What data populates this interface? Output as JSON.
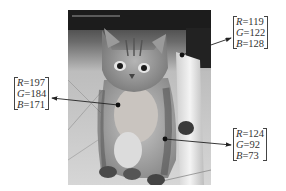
{
  "figure": {
    "image_subject": "cat"
  },
  "callouts": [
    {
      "id": "top-right",
      "position": "top-right",
      "R": {
        "label": "R",
        "value": "=119"
      },
      "G": {
        "label": "G",
        "value": "=122"
      },
      "B": {
        "label": "B",
        "value": "=128"
      },
      "point": [
        182,
        55
      ],
      "arrow_end": [
        232,
        38
      ]
    },
    {
      "id": "left",
      "position": "left",
      "R": {
        "label": "R",
        "value": "=197"
      },
      "G": {
        "label": "G",
        "value": "=184"
      },
      "B": {
        "label": "B",
        "value": "=171"
      },
      "point": [
        118,
        105
      ],
      "arrow_end": [
        51,
        98
      ]
    },
    {
      "id": "bottom-right",
      "position": "bottom-right",
      "R": {
        "label": "R",
        "value": "=124"
      },
      "G": {
        "label": "G",
        "value": "=92"
      },
      "B": {
        "label": "B",
        "value": "=73"
      },
      "point": [
        165,
        139
      ],
      "arrow_end": [
        232,
        145
      ]
    }
  ]
}
